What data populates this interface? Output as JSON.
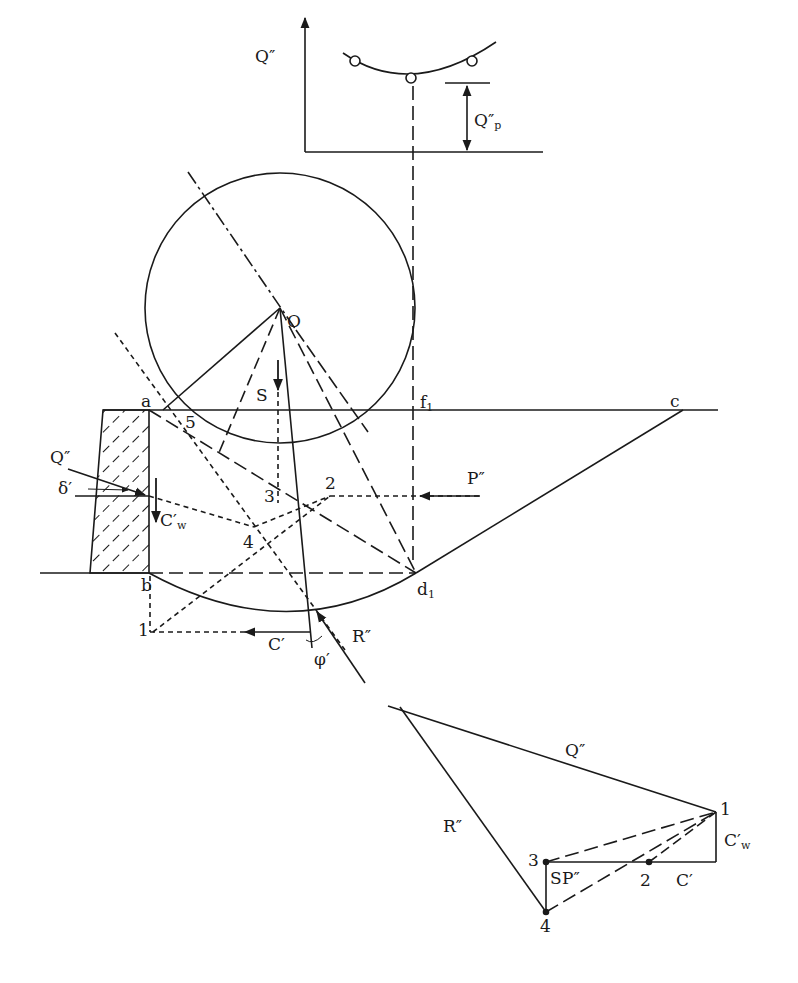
{
  "figure": {
    "colors": {
      "ink": "#1a1a1a",
      "background": "#ffffff"
    }
  },
  "top_plot": {
    "y_axis_label": "Q″",
    "min_label": "Q″",
    "min_label_sub": "p",
    "points": [
      {
        "x": 355,
        "y": 61
      },
      {
        "x": 411,
        "y": 78
      },
      {
        "x": 472,
        "y": 61
      }
    ]
  },
  "main_labels": {
    "O": "O",
    "a": "a",
    "b": "b",
    "c": "c",
    "d1": "d",
    "d1_sub": "1",
    "f1": "f",
    "f1_sub": "1",
    "S": "S",
    "P": "P″",
    "Q": "Q″",
    "delta": "δ′",
    "Cw": "C′",
    "Cw_sub": "w",
    "C": "C′",
    "R": "R″",
    "phi": "φ′",
    "n1": "1",
    "n2": "2",
    "n3": "3",
    "n4": "4",
    "n5": "5"
  },
  "force_polygon": {
    "Q": "Q″",
    "R": "R″",
    "Cw": "C′",
    "Cw_sub": "w",
    "C": "C′",
    "P": "P″",
    "S": "S",
    "n1": "1",
    "n2": "2",
    "n3": "3",
    "n4": "4"
  }
}
